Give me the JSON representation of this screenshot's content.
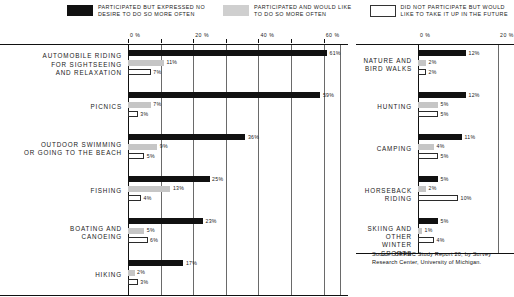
{
  "legend": {
    "items": [
      {
        "swatch": "black",
        "line1": "PARTICIPATED BUT EXPRESSED NO",
        "line2": "DESIRE TO DO SO MORE OFTEN"
      },
      {
        "swatch": "gray",
        "line1": "PARTICIPATED AND WOULD LIKE",
        "line2": "TO DO SO MORE OFTEN"
      },
      {
        "swatch": "white",
        "line1": "DID NOT PARTICIPATE BUT WOULD",
        "line2": "LIKE TO TAKE IT UP IN THE FUTURE"
      }
    ]
  },
  "source": "Source: ORRRC Study Report 20, by Survey\nResearch Center, University of Michigan.",
  "chart_data": [
    {
      "type": "bar",
      "id": "left-panel",
      "title": "",
      "xlabel": "",
      "ylabel": "",
      "orientation": "horizontal",
      "xlim": [
        0,
        65
      ],
      "xticks": [
        0,
        20,
        40,
        60
      ],
      "xticklabels": [
        "0 %",
        "20 %",
        "40 %",
        "60 %"
      ],
      "grid": true,
      "legend": [
        "PARTICIPATED BUT EXPRESSED NO DESIRE TO DO SO MORE OFTEN",
        "PARTICIPATED AND WOULD LIKE TO DO SO MORE OFTEN",
        "DID NOT PARTICIPATE BUT WOULD LIKE TO TAKE IT UP IN THE FUTURE"
      ],
      "categories": [
        "AUTOMOBILE RIDING\nFOR SIGHTSEEING\nAND RELAXATION",
        "PICNICS",
        "OUTDOOR SWIMMING\nOR GOING TO THE BEACH",
        "FISHING",
        "BOATING AND\nCANOEING",
        "HIKING"
      ],
      "series": [
        {
          "name": "no-desire-more",
          "values": [
            61,
            59,
            36,
            25,
            23,
            17
          ],
          "labels": [
            "61%",
            "59%",
            "36%",
            "25%",
            "23%",
            "17%"
          ]
        },
        {
          "name": "would-like-more",
          "values": [
            11,
            7,
            9,
            13,
            5,
            2
          ],
          "labels": [
            "11%",
            "7%",
            "9%",
            "13%",
            "5%",
            "2%"
          ]
        },
        {
          "name": "take-up-future",
          "values": [
            7,
            3,
            5,
            4,
            6,
            3
          ],
          "labels": [
            "7%",
            "3%",
            "5%",
            "4%",
            "6%",
            "3%"
          ]
        }
      ]
    },
    {
      "type": "bar",
      "id": "right-panel",
      "title": "",
      "xlabel": "",
      "ylabel": "",
      "orientation": "horizontal",
      "xlim": [
        0,
        22
      ],
      "xticks": [
        0,
        20
      ],
      "xticklabels": [
        "0 %",
        "20 %"
      ],
      "grid": true,
      "categories": [
        "NATURE AND\nBIRD WALKS",
        "HUNTING",
        "CAMPING",
        "HORSEBACK RIDING",
        "SKIING AND OTHER\nWINTER SPORTS"
      ],
      "series": [
        {
          "name": "no-desire-more",
          "values": [
            12,
            12,
            11,
            5,
            5
          ],
          "labels": [
            "12%",
            "12%",
            "11%",
            "5%",
            "5%"
          ]
        },
        {
          "name": "would-like-more",
          "values": [
            2,
            5,
            4,
            2,
            1
          ],
          "labels": [
            "2%",
            "5%",
            "4%",
            "2%",
            "1%"
          ]
        },
        {
          "name": "take-up-future",
          "values": [
            2,
            5,
            5,
            10,
            4
          ],
          "labels": [
            "2%",
            "5%",
            "5%",
            "10%",
            "4%"
          ]
        }
      ]
    }
  ]
}
